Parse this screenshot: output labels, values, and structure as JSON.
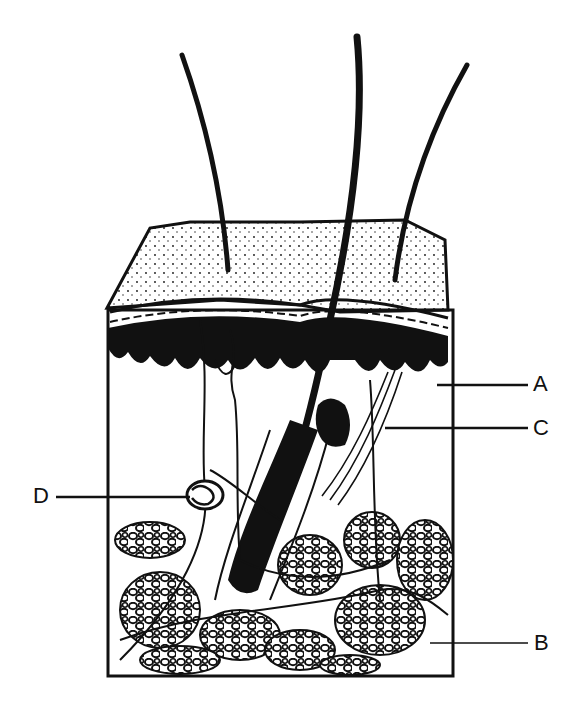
{
  "diagram": {
    "colors": {
      "ink": "#111111",
      "background": "#ffffff"
    },
    "labels": [
      {
        "id": "A",
        "text": "A",
        "x": 533,
        "y": 382
      },
      {
        "id": "C",
        "text": "C",
        "x": 533,
        "y": 428
      },
      {
        "id": "D",
        "text": "D",
        "x": 34,
        "y": 495
      },
      {
        "id": "B",
        "text": "B",
        "x": 534,
        "y": 642
      }
    ]
  }
}
